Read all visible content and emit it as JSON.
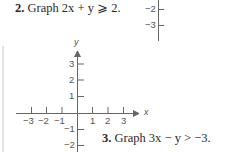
{
  "problems": [
    {
      "number": "2.",
      "text": "Graph 2x + y ⩾ 2."
    },
    {
      "number": "3.",
      "text": "Graph 3x − y > −3."
    }
  ],
  "top_axis_fragment": {
    "tick_labels": [
      "−2",
      "−3"
    ]
  },
  "graph": {
    "x_axis_label": "x",
    "y_axis_label": "y",
    "x_tick_labels": [
      "−3",
      "−2",
      "−1",
      "1",
      "2",
      "3"
    ],
    "y_tick_labels": [
      "3",
      "2",
      "1",
      "−1",
      "−2"
    ]
  },
  "colors": {
    "text": "#2a2a2a",
    "axis": "#666666",
    "border": "#d8d8d8"
  }
}
